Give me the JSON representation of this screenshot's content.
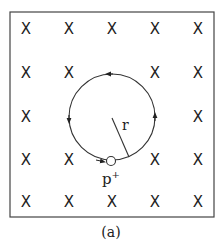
{
  "diagram": {
    "field_symbol": "X",
    "field_grid": {
      "cols": [
        26,
        69,
        112,
        155,
        198
      ],
      "rows": [
        29,
        73,
        117,
        160,
        202
      ],
      "hidden": [
        [
          1,
          2
        ],
        [
          2,
          1
        ],
        [
          2,
          2
        ],
        [
          2,
          3
        ],
        [
          3,
          2
        ]
      ]
    },
    "radius_label": "r",
    "particle_label": "p",
    "particle_charge": "+",
    "caption": "(a)"
  }
}
